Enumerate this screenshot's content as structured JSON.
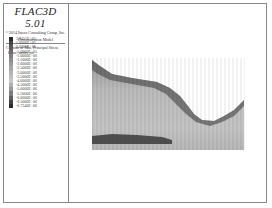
{
  "legend": {
    "title": "FLAC3D 5.01",
    "copyright": "©2014 Itasca Consulting Group, Inc.",
    "model": "Demonstration Model",
    "contour": "Contour of Min. Principal Stress",
    "plane": "Plane: active on",
    "scale": [
      {
        "value": "3.9451E+05",
        "color": "#2a2a2a"
      },
      {
        "value": "5.0000E+05",
        "color": "#444444"
      },
      {
        "value": "0.0000E+00",
        "color": "#5a5a5a"
      },
      {
        "value": "-5.0000E+05",
        "color": "#6e6e6e"
      },
      {
        "value": "-1.0000E+06",
        "color": "#808080"
      },
      {
        "value": "-1.5000E+06",
        "color": "#8e8e8e"
      },
      {
        "value": "-2.0000E+06",
        "color": "#9c9c9c"
      },
      {
        "value": "-2.5000E+06",
        "color": "#a8a8a8"
      },
      {
        "value": "-3.0000E+06",
        "color": "#b4b4b4"
      },
      {
        "value": "-3.5000E+06",
        "color": "#bebebe"
      },
      {
        "value": "-4.0000E+06",
        "color": "#c8c8c8"
      },
      {
        "value": "-4.5000E+06",
        "color": "#b0b0b0"
      },
      {
        "value": "-5.0000E+06",
        "color": "#989898"
      },
      {
        "value": "-5.5000E+06",
        "color": "#7c7c7c"
      },
      {
        "value": "-6.0000E+06",
        "color": "#606060"
      },
      {
        "value": "-6.5000E+06",
        "color": "#444444"
      },
      {
        "value": "-6.7240E+06",
        "color": "#2c2c2c"
      }
    ]
  }
}
